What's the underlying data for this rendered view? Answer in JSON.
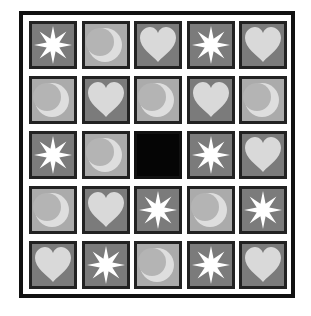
{
  "game": {
    "title": "Tile sliding puzzle",
    "rows": 5,
    "cols": 5,
    "empty_position": {
      "row": 2,
      "col": 2
    },
    "colors": {
      "frame": "#111111",
      "tile_dark_bg": "#7b7b7b",
      "tile_light_bg": "#ababab",
      "star_fill": "#ffffff",
      "heart_fill": "#d9d9d9",
      "moon_fill": "#dedede",
      "empty_tile": "#050505"
    },
    "tiles": [
      [
        "star",
        "moon",
        "heart",
        "star",
        "heart"
      ],
      [
        "moon",
        "heart",
        "moon",
        "heart",
        "moon"
      ],
      [
        "star",
        "moon",
        "empty",
        "star",
        "heart"
      ],
      [
        "moon",
        "heart",
        "star",
        "moon",
        "star"
      ],
      [
        "heart",
        "star",
        "moon",
        "star",
        "heart"
      ]
    ]
  }
}
